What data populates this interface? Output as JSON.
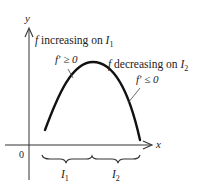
{
  "diagram": {
    "axes": {
      "x_label": "x",
      "y_label": "y",
      "origin_label": "0"
    },
    "curve": {
      "description": "concave-down arch",
      "start": [
        45,
        130
      ],
      "peak": [
        93,
        62
      ],
      "end": [
        140,
        140
      ]
    },
    "annotations": {
      "increasing": {
        "prefix": "f",
        "text": " increasing on ",
        "interval": "I",
        "subscript": "1"
      },
      "increasing_derivative": "f′ ≥ 0",
      "decreasing": {
        "prefix": "f",
        "text": " decreasing on ",
        "interval": "I",
        "subscript": "2"
      },
      "decreasing_derivative": "f′ ≤ 0"
    },
    "intervals": [
      {
        "label": "I",
        "subscript": "1"
      },
      {
        "label": "I",
        "subscript": "2"
      }
    ],
    "colors": {
      "ink": "#222222",
      "background": "#ffffff"
    }
  }
}
